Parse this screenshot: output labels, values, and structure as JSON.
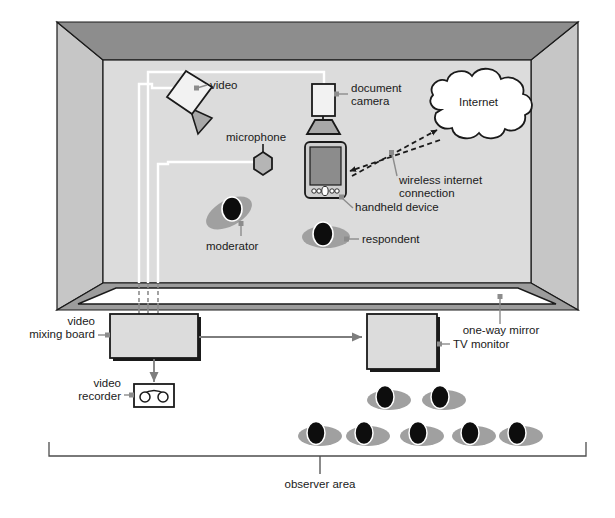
{
  "diagram": {
    "type": "room-layout-diagram"
  },
  "colors": {
    "ceiling": "#8d8d8d",
    "wall_left": "#c6c6c6",
    "wall_right": "#c6c6c6",
    "floor_interior": "#dcdcdc",
    "mirror_band": "#9c9c9c",
    "mirror_face": "#ffffff",
    "outline": "#1a1a1a",
    "cable_white": "#ffffff",
    "cable_dashed": "#8c8c8c",
    "leader": "#8c8c8c",
    "device_fill": "#d9d9d9",
    "screen_fill": "#8c8c8c",
    "person_body": "#a0a0a0",
    "person_head": "#0d0d0d",
    "text": "#1a1a1a",
    "cloud_fill": "#ffffff",
    "arrow": "#7d7d7d"
  },
  "labels": {
    "video": "video",
    "document_camera_line1": "document",
    "document_camera_line2": "camera",
    "internet": "Internet",
    "microphone": "microphone",
    "wireless_line1": "wireless internet",
    "wireless_line2": "connection",
    "handheld_device": "handheld device",
    "moderator": "moderator",
    "respondent": "respondent",
    "one_way_mirror": "one-way mirror",
    "video_mixing_board_line1": "video",
    "video_mixing_board_line2": "mixing board",
    "tv_monitor": "TV monitor",
    "video_recorder_line1": "video",
    "video_recorder_line2": "recorder",
    "observer_area": "observer area"
  },
  "equipment": [
    {
      "name": "video-camera",
      "label": "video"
    },
    {
      "name": "document-camera",
      "label": "document camera"
    },
    {
      "name": "microphone",
      "label": "microphone"
    },
    {
      "name": "handheld-device",
      "label": "handheld device"
    },
    {
      "name": "internet-cloud",
      "label": "Internet"
    },
    {
      "name": "video-mixing-board",
      "label": "video mixing board"
    },
    {
      "name": "video-recorder",
      "label": "video recorder"
    },
    {
      "name": "tv-monitor",
      "label": "TV monitor"
    },
    {
      "name": "one-way-mirror",
      "label": "one-way mirror"
    }
  ],
  "people": {
    "moderator_count": 1,
    "respondent_count": 1,
    "observers_back_row": 2,
    "observers_front_row": 5,
    "observers_total": 7
  },
  "connections": [
    {
      "from": "handheld-device",
      "to": "internet-cloud",
      "style": "dashed-double-arrow",
      "label": "wireless internet connection"
    },
    {
      "from": "video-mixing-board",
      "to": "tv-monitor",
      "style": "arrow"
    },
    {
      "from": "video-mixing-board",
      "to": "video-recorder",
      "style": "arrow"
    },
    {
      "from": "video-camera",
      "to": "video-mixing-board",
      "style": "cable"
    },
    {
      "from": "document-camera",
      "to": "video-mixing-board",
      "style": "cable"
    },
    {
      "from": "microphone",
      "to": "video-mixing-board",
      "style": "cable"
    }
  ]
}
